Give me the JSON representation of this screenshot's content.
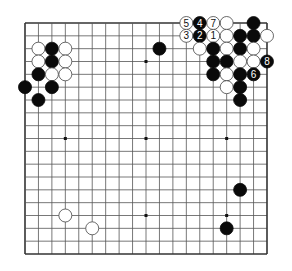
{
  "diagram": {
    "type": "go-board",
    "size": 19,
    "colors": {
      "line": "#555555",
      "edge": "#333333",
      "black": "#0a0a0a",
      "white": "#ffffff",
      "white_stroke": "#444444",
      "star": "#111111"
    },
    "star_points": [
      [
        3,
        3
      ],
      [
        9,
        3
      ],
      [
        15,
        3
      ],
      [
        3,
        9
      ],
      [
        9,
        9
      ],
      [
        15,
        9
      ],
      [
        3,
        15
      ],
      [
        9,
        15
      ],
      [
        15,
        15
      ]
    ],
    "stones": [
      {
        "c": 1,
        "r": 2,
        "color": "W"
      },
      {
        "c": 2,
        "r": 2,
        "color": "B"
      },
      {
        "c": 3,
        "r": 2,
        "color": "W"
      },
      {
        "c": 1,
        "r": 3,
        "color": "W"
      },
      {
        "c": 2,
        "r": 3,
        "color": "B"
      },
      {
        "c": 3,
        "r": 3,
        "color": "W"
      },
      {
        "c": 1,
        "r": 4,
        "color": "B"
      },
      {
        "c": 2,
        "r": 4,
        "color": "W"
      },
      {
        "c": 3,
        "r": 4,
        "color": "W"
      },
      {
        "c": 0,
        "r": 5,
        "color": "B"
      },
      {
        "c": 2,
        "r": 5,
        "color": "B"
      },
      {
        "c": 1,
        "r": 6,
        "color": "B"
      },
      {
        "c": 10,
        "r": 2,
        "color": "B"
      },
      {
        "c": 12,
        "r": 0,
        "color": "W",
        "label": "5"
      },
      {
        "c": 13,
        "r": 0,
        "color": "B",
        "label": "4"
      },
      {
        "c": 14,
        "r": 0,
        "color": "W",
        "label": "7"
      },
      {
        "c": 15,
        "r": 0,
        "color": "W"
      },
      {
        "c": 17,
        "r": 0,
        "color": "B"
      },
      {
        "c": 12,
        "r": 1,
        "color": "W",
        "label": "3"
      },
      {
        "c": 13,
        "r": 1,
        "color": "B",
        "label": "2"
      },
      {
        "c": 14,
        "r": 1,
        "color": "W",
        "label": "1"
      },
      {
        "c": 15,
        "r": 1,
        "color": "W"
      },
      {
        "c": 16,
        "r": 1,
        "color": "B"
      },
      {
        "c": 17,
        "r": 1,
        "color": "B"
      },
      {
        "c": 18,
        "r": 1,
        "color": "W"
      },
      {
        "c": 13,
        "r": 2,
        "color": "W"
      },
      {
        "c": 14,
        "r": 2,
        "color": "B"
      },
      {
        "c": 15,
        "r": 2,
        "color": "W"
      },
      {
        "c": 16,
        "r": 2,
        "color": "B"
      },
      {
        "c": 17,
        "r": 2,
        "color": "W"
      },
      {
        "c": 14,
        "r": 3,
        "color": "B"
      },
      {
        "c": 15,
        "r": 3,
        "color": "B"
      },
      {
        "c": 16,
        "r": 3,
        "color": "W"
      },
      {
        "c": 17,
        "r": 3,
        "color": "W"
      },
      {
        "c": 18,
        "r": 3,
        "color": "B",
        "label": "8"
      },
      {
        "c": 14,
        "r": 4,
        "color": "B"
      },
      {
        "c": 15,
        "r": 4,
        "color": "W"
      },
      {
        "c": 16,
        "r": 4,
        "color": "B"
      },
      {
        "c": 17,
        "r": 4,
        "color": "B",
        "label": "6"
      },
      {
        "c": 15,
        "r": 5,
        "color": "W"
      },
      {
        "c": 16,
        "r": 5,
        "color": "B"
      },
      {
        "c": 16,
        "r": 6,
        "color": "B"
      },
      {
        "c": 16,
        "r": 13,
        "color": "B"
      },
      {
        "c": 3,
        "r": 15,
        "color": "W"
      },
      {
        "c": 5,
        "r": 16,
        "color": "W"
      },
      {
        "c": 15,
        "r": 16,
        "color": "B"
      }
    ]
  }
}
